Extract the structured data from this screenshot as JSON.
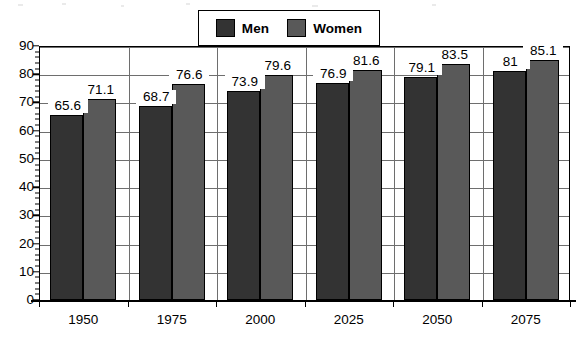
{
  "chart_data": {
    "type": "bar",
    "title": "",
    "subtitle": "",
    "xlabel": "",
    "ylabel": "",
    "categories": [
      "1950",
      "1975",
      "2000",
      "2025",
      "2050",
      "2075"
    ],
    "series": [
      {
        "name": "Men",
        "color": "#333333",
        "values": [
          65.6,
          68.7,
          73.9,
          76.9,
          79.1,
          81
        ],
        "value_labels": [
          "65.6",
          "68.7",
          "73.9",
          "76.9",
          "79.1",
          "81"
        ]
      },
      {
        "name": "Women",
        "color": "#595959",
        "values": [
          71.1,
          76.6,
          79.6,
          81.6,
          83.5,
          85.1
        ],
        "value_labels": [
          "71.1",
          "76.6",
          "79.6",
          "81.6",
          "83.5",
          "85.1"
        ]
      }
    ],
    "ylim": [
      0,
      90
    ],
    "ytick_step": 10,
    "yticks": [
      0,
      10,
      20,
      30,
      40,
      50,
      60,
      70,
      80,
      90
    ],
    "ytick_labels": [
      "0",
      "10",
      "20",
      "30",
      "40",
      "50",
      "60",
      "70",
      "80",
      "90"
    ],
    "minor_ticks": true,
    "grid": "horizontal-and-category-separators",
    "legend_position": "top-center",
    "legend_entries": [
      {
        "label": "Men",
        "color": "#333333"
      },
      {
        "label": "Women",
        "color": "#595959"
      }
    ]
  },
  "legend": {
    "men_label": "Men",
    "women_label": "Women"
  },
  "axis": {
    "y_labels": [
      "90",
      "80",
      "70",
      "60",
      "50",
      "40",
      "30",
      "20",
      "10",
      "0"
    ],
    "x_labels": [
      "1950",
      "1975",
      "2000",
      "2025",
      "2050",
      "2075"
    ]
  },
  "colors": {
    "men": "#333333",
    "women": "#595959",
    "axis": "#000000",
    "grid": "#6e6e6e",
    "background": "#ffffff"
  }
}
